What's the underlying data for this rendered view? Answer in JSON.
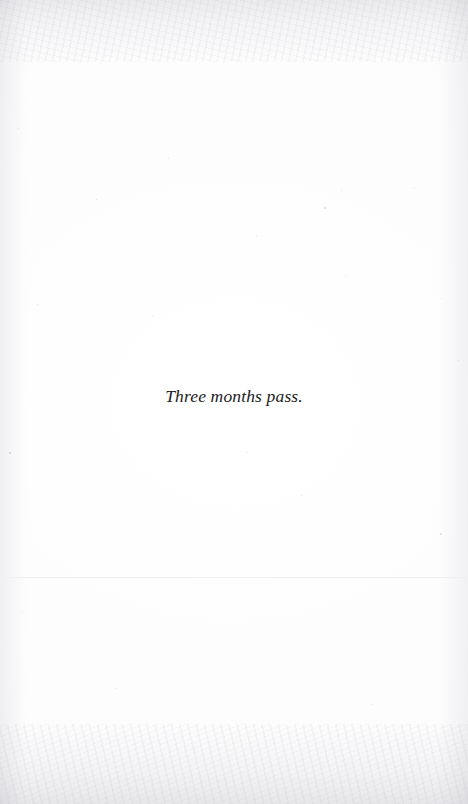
{
  "page": {
    "kind": "scanned-book-page",
    "width": 468,
    "height": 804,
    "background_color": "#fdfdfe",
    "text_color": "#1b1b1d",
    "rule_color": "#eff0f2"
  },
  "content": {
    "body_line": "Three months pass."
  },
  "marks": {
    "horizontal_rule_present": true,
    "specks": [
      {
        "x": 18,
        "y": 128,
        "size": 1.4
      },
      {
        "x": 37,
        "y": 304,
        "size": 1.1
      },
      {
        "x": 9,
        "y": 452,
        "size": 1.6
      },
      {
        "x": 22,
        "y": 611,
        "size": 1.2
      },
      {
        "x": 96,
        "y": 199,
        "size": 1.0
      },
      {
        "x": 168,
        "y": 158,
        "size": 1.3
      },
      {
        "x": 152,
        "y": 316,
        "size": 1.1
      },
      {
        "x": 256,
        "y": 236,
        "size": 1.0
      },
      {
        "x": 324,
        "y": 207,
        "size": 1.5
      },
      {
        "x": 341,
        "y": 190,
        "size": 1.1
      },
      {
        "x": 345,
        "y": 275,
        "size": 1.2
      },
      {
        "x": 414,
        "y": 188,
        "size": 1.0
      },
      {
        "x": 440,
        "y": 533,
        "size": 1.8
      },
      {
        "x": 441,
        "y": 298,
        "size": 1.1
      },
      {
        "x": 458,
        "y": 360,
        "size": 1.3
      },
      {
        "x": 247,
        "y": 452,
        "size": 1.0
      },
      {
        "x": 301,
        "y": 495,
        "size": 1.2
      },
      {
        "x": 116,
        "y": 688,
        "size": 1.1
      },
      {
        "x": 372,
        "y": 704,
        "size": 1.0
      }
    ]
  }
}
